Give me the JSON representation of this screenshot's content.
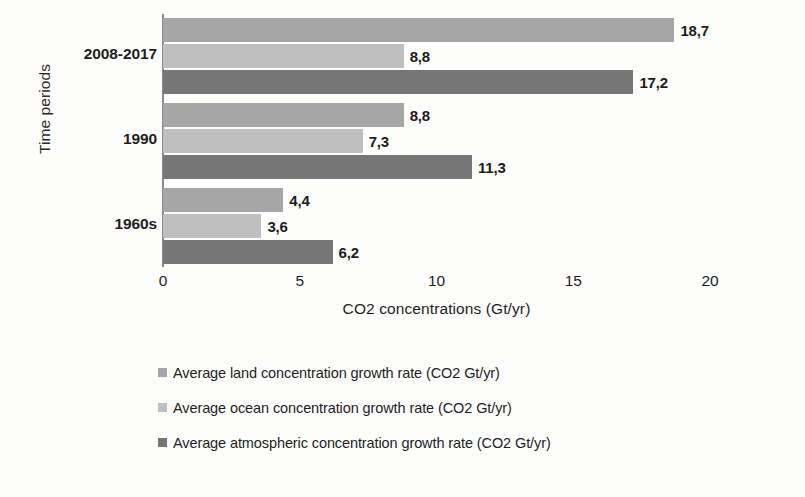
{
  "chart_data": {
    "type": "bar",
    "orientation": "horizontal",
    "title": "",
    "xlabel": "CO2 concentrations (Gt/yr)",
    "ylabel": "Time periods",
    "categories": [
      "2008-2017",
      "1990",
      "1960s"
    ],
    "xlim": [
      0,
      20
    ],
    "xticks": [
      "0",
      "5",
      "10",
      "15",
      "20"
    ],
    "grid": false,
    "legend_position": "bottom-left",
    "decimal_separator": ",",
    "series": [
      {
        "name": "Average land concentration growth rate (CO2 Gt/yr)",
        "color": "#a6a6a6",
        "values": [
          18.7,
          8.8,
          4.4
        ],
        "labels": [
          "18,7",
          "8,8",
          "4,4"
        ]
      },
      {
        "name": "Average ocean concentration growth rate (CO2 Gt/yr)",
        "color": "#bfbfbf",
        "values": [
          8.8,
          7.3,
          3.6
        ],
        "labels": [
          "8,8",
          "7,3",
          "3,6"
        ]
      },
      {
        "name": "Average atmospheric concentration growth rate (CO2 Gt/yr)",
        "color": "#767676",
        "values": [
          17.2,
          11.3,
          6.2
        ],
        "labels": [
          "17,2",
          "11,3",
          "6,2"
        ]
      }
    ]
  }
}
